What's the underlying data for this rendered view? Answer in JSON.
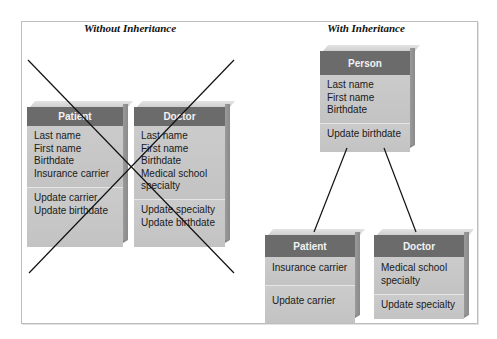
{
  "diagram": {
    "panels": [
      {
        "title": "Without Inheritance",
        "crossed_out": true,
        "classes": [
          {
            "name": "Patient",
            "attributes": [
              "Last name",
              "First name",
              "Birthdate",
              "Insurance carrier"
            ],
            "methods": [
              "Update carrier",
              "Update birthdate"
            ]
          },
          {
            "name": "Doctor",
            "attributes": [
              "Last name",
              "First name",
              "Birthdate",
              "Medical school",
              "specialty"
            ],
            "methods": [
              "Update specialty",
              "Update birthdate"
            ]
          }
        ]
      },
      {
        "title": "With Inheritance",
        "crossed_out": false,
        "parent": {
          "name": "Person",
          "attributes": [
            "Last name",
            "First name",
            "Birthdate"
          ],
          "methods": [
            "Update birthdate"
          ]
        },
        "children": [
          {
            "name": "Patient",
            "attributes": [
              "Insurance carrier"
            ],
            "methods": [
              "Update carrier"
            ]
          },
          {
            "name": "Doctor",
            "attributes": [
              "Medical school",
              "specialty"
            ],
            "methods": [
              "Update specialty"
            ]
          }
        ]
      }
    ],
    "colors": {
      "header": "#6b6b6b",
      "body": "#c7c7c7",
      "line": "#111111",
      "frame": "#bdbdbd"
    }
  }
}
